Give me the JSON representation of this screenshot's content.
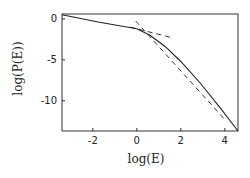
{
  "chart_data": {
    "type": "line",
    "title": "",
    "xlabel": "log(E)",
    "ylabel": "log(P(E))",
    "xlim": [
      -3.4,
      4.6
    ],
    "ylim": [
      -13.7,
      0.6
    ],
    "xticks": [
      -2,
      0,
      2,
      4
    ],
    "xtick_labels": [
      "-2",
      "0",
      "2",
      "4"
    ],
    "yticks": [
      0,
      -5,
      -10
    ],
    "ytick_labels": [
      "0",
      "-5",
      "-10"
    ],
    "grid": false,
    "legend": null,
    "series": [
      {
        "name": "P(E) solid",
        "style": "solid",
        "x": [
          -3.4,
          -1.7,
          0.0,
          0.6,
          1.3,
          2.0,
          2.9,
          3.8,
          4.6
        ],
        "y": [
          0.5,
          -0.4,
          -1.2,
          -2.0,
          -3.4,
          -5.2,
          -7.9,
          -10.9,
          -13.7
        ]
      },
      {
        "name": "low-energy asymptote",
        "style": "dashed",
        "x": [
          -0.3,
          1.6
        ],
        "y": [
          -1.0,
          -2.3
        ]
      },
      {
        "name": "high-energy asymptote",
        "style": "dashed",
        "x": [
          -0.05,
          4.0
        ],
        "y": [
          -0.25,
          -12.3
        ]
      }
    ]
  },
  "layout": {
    "plot_left": 62,
    "plot_top": 14,
    "plot_right": 238,
    "plot_bottom": 131,
    "line_color": "#222222"
  }
}
